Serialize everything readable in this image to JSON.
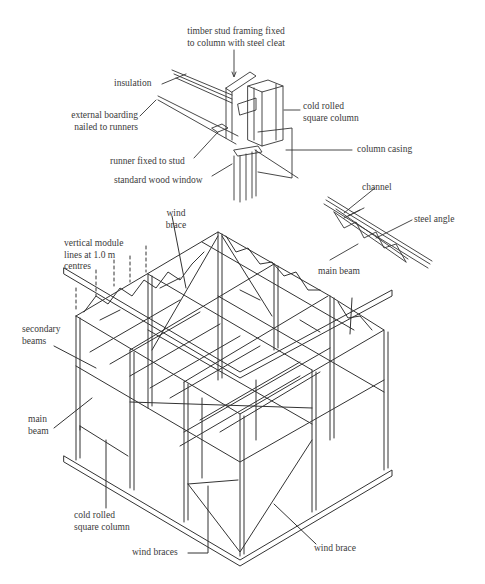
{
  "diagram": {
    "detail_labels": {
      "timber_stud_line1": "timber stud framing fixed",
      "timber_stud_line2": "to column with steel cleat",
      "insulation": "insulation",
      "external_boarding_line1": "external boarding",
      "external_boarding_line2": "nailed to runners",
      "cold_rolled_line1": "cold rolled",
      "cold_rolled_line2": "square column",
      "column_casing": "column casing",
      "runner": "runner fixed to stud",
      "window": "standard wood window"
    },
    "beam_detail_labels": {
      "channel": "channel",
      "steel_angle": "steel angle",
      "main_beam": "main beam"
    },
    "frame_labels": {
      "wind_brace_top_line1": "wind",
      "wind_brace_top_line2": "brace",
      "module_line1": "vertical module",
      "module_line2": "lines at 1.0 m",
      "module_line3": "centres",
      "main_beam_right": "main beam",
      "secondary_line1": "secondary",
      "secondary_line2": "beams",
      "main_beam_left_line1": "main",
      "main_beam_left_line2": "beam",
      "column_line1": "cold rolled",
      "column_line2": "square column",
      "wind_braces": "wind braces",
      "wind_brace_bottom": "wind brace"
    },
    "colors": {
      "line": "#333333",
      "background": "#ffffff"
    }
  }
}
